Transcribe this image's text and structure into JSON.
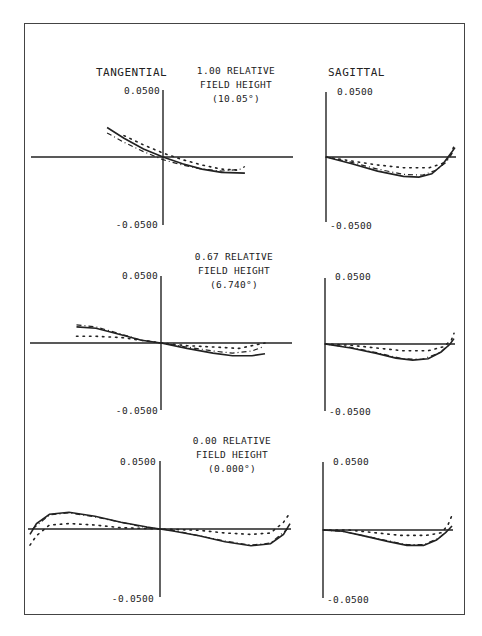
{
  "headers": {
    "tangential": "TANGENTIAL",
    "sagittal": "SAGITTAL"
  },
  "fields": [
    {
      "line1": "1.00 RELATIVE",
      "line2": "FIELD HEIGHT",
      "line3": "(10.05°)"
    },
    {
      "line1": "0.67 RELATIVE",
      "line2": "FIELD HEIGHT",
      "line3": "(6.740°)"
    },
    {
      "line1": "0.00 RELATIVE",
      "line2": "FIELD HEIGHT",
      "line3": "(0.000°)"
    }
  ],
  "axis_labels": {
    "top": "0.0500",
    "bottom": "-0.0500"
  },
  "colors": {
    "line": "#222222",
    "frame": "#444444",
    "background": "#ffffff"
  },
  "chart_data": [
    {
      "type": "line",
      "title": "TANGENTIAL — 1.00 RELATIVE FIELD HEIGHT (10.05°)",
      "xlabel": "relative pupil height",
      "ylabel": "ray aberration",
      "xlim": [
        -1,
        1
      ],
      "ylim": [
        -0.05,
        0.05
      ],
      "series": [
        {
          "name": "solid",
          "style": "solid",
          "points": [
            [
              -0.43,
              0.022
            ],
            [
              -0.3,
              0.014
            ],
            [
              -0.15,
              0.006
            ],
            [
              0,
              0.0
            ],
            [
              0.15,
              -0.005
            ],
            [
              0.3,
              -0.009
            ],
            [
              0.45,
              -0.0115
            ],
            [
              0.63,
              -0.012
            ]
          ]
        },
        {
          "name": "dashed",
          "style": "dashed",
          "points": [
            [
              -0.43,
              0.018
            ],
            [
              -0.3,
              0.011
            ],
            [
              -0.15,
              0.004
            ],
            [
              0,
              -0.002
            ],
            [
              0.15,
              -0.006
            ],
            [
              0.3,
              -0.009
            ],
            [
              0.45,
              -0.0105
            ],
            [
              0.6,
              -0.009
            ],
            [
              0.63,
              -0.007
            ]
          ]
        },
        {
          "name": "dotted",
          "style": "dotted",
          "points": [
            [
              -0.3,
              0.016
            ],
            [
              -0.15,
              0.009
            ],
            [
              0,
              0.003
            ],
            [
              0.15,
              -0.002
            ],
            [
              0.3,
              -0.006
            ],
            [
              0.45,
              -0.009
            ],
            [
              0.6,
              -0.01
            ]
          ]
        }
      ]
    },
    {
      "type": "line",
      "title": "SAGITTAL — 1.00 RELATIVE FIELD HEIGHT (10.05°)",
      "xlim": [
        0,
        1
      ],
      "ylim": [
        -0.05,
        0.05
      ],
      "series": [
        {
          "name": "solid",
          "style": "solid",
          "points": [
            [
              0,
              0
            ],
            [
              0.2,
              -0.005
            ],
            [
              0.4,
              -0.0105
            ],
            [
              0.6,
              -0.0145
            ],
            [
              0.72,
              -0.015
            ],
            [
              0.82,
              -0.0125
            ],
            [
              0.9,
              -0.006
            ],
            [
              0.97,
              0.003
            ],
            [
              1.0,
              0.007
            ]
          ]
        },
        {
          "name": "dashed",
          "style": "dashed",
          "points": [
            [
              0,
              0
            ],
            [
              0.2,
              -0.004
            ],
            [
              0.4,
              -0.009
            ],
            [
              0.6,
              -0.013
            ],
            [
              0.75,
              -0.0135
            ],
            [
              0.85,
              -0.01
            ],
            [
              0.93,
              -0.004
            ],
            [
              0.98,
              0.003
            ]
          ]
        },
        {
          "name": "dotted",
          "style": "dotted",
          "points": [
            [
              0,
              0
            ],
            [
              0.2,
              -0.003
            ],
            [
              0.4,
              -0.006
            ],
            [
              0.6,
              -0.008
            ],
            [
              0.8,
              -0.008
            ],
            [
              0.9,
              -0.005
            ],
            [
              0.96,
              0.0
            ],
            [
              1.0,
              0.01
            ]
          ]
        }
      ]
    },
    {
      "type": "line",
      "title": "TANGENTIAL — 0.67 RELATIVE FIELD HEIGHT (6.740°)",
      "xlim": [
        -1,
        1
      ],
      "ylim": [
        -0.05,
        0.05
      ],
      "series": [
        {
          "name": "solid",
          "style": "solid",
          "points": [
            [
              -0.65,
              0.012
            ],
            [
              -0.5,
              0.011
            ],
            [
              -0.3,
              0.006
            ],
            [
              -0.15,
              0.002
            ],
            [
              0,
              0.0
            ],
            [
              0.2,
              -0.004
            ],
            [
              0.4,
              -0.0075
            ],
            [
              0.55,
              -0.0095
            ],
            [
              0.7,
              -0.0095
            ],
            [
              0.8,
              -0.008
            ]
          ]
        },
        {
          "name": "dashed",
          "style": "dashed",
          "points": [
            [
              -0.65,
              0.0135
            ],
            [
              -0.5,
              0.012
            ],
            [
              -0.3,
              0.0065
            ],
            [
              -0.15,
              0.002
            ],
            [
              0,
              0.0
            ],
            [
              0.2,
              -0.003
            ],
            [
              0.4,
              -0.006
            ],
            [
              0.55,
              -0.0075
            ],
            [
              0.7,
              -0.006
            ],
            [
              0.78,
              -0.003
            ]
          ]
        },
        {
          "name": "dotted",
          "style": "dotted",
          "points": [
            [
              -0.65,
              0.005
            ],
            [
              -0.5,
              0.005
            ],
            [
              -0.3,
              0.004
            ],
            [
              -0.15,
              0.002
            ],
            [
              0,
              0.0
            ],
            [
              0.2,
              -0.002
            ],
            [
              0.4,
              -0.003
            ],
            [
              0.6,
              -0.004
            ],
            [
              0.8,
              0.0
            ]
          ]
        }
      ]
    },
    {
      "type": "line",
      "title": "SAGITTAL — 0.67 RELATIVE FIELD HEIGHT (6.740°)",
      "xlim": [
        0,
        1
      ],
      "ylim": [
        -0.05,
        0.05
      ],
      "series": [
        {
          "name": "solid",
          "style": "solid",
          "points": [
            [
              0,
              0
            ],
            [
              0.2,
              -0.003
            ],
            [
              0.4,
              -0.007
            ],
            [
              0.55,
              -0.0105
            ],
            [
              0.68,
              -0.012
            ],
            [
              0.8,
              -0.011
            ],
            [
              0.9,
              -0.006
            ],
            [
              0.97,
              0.0
            ],
            [
              1.0,
              0.004
            ]
          ]
        },
        {
          "name": "dashed",
          "style": "dashed",
          "points": [
            [
              0,
              0
            ],
            [
              0.2,
              -0.0025
            ],
            [
              0.4,
              -0.0065
            ],
            [
              0.6,
              -0.011
            ],
            [
              0.75,
              -0.0115
            ],
            [
              0.88,
              -0.007
            ],
            [
              0.96,
              -0.001
            ]
          ]
        },
        {
          "name": "dotted",
          "style": "dotted",
          "points": [
            [
              0,
              0
            ],
            [
              0.2,
              -0.001
            ],
            [
              0.4,
              -0.003
            ],
            [
              0.6,
              -0.005
            ],
            [
              0.8,
              -0.005
            ],
            [
              0.92,
              -0.002
            ],
            [
              0.98,
              0.003
            ],
            [
              1.0,
              0.008
            ]
          ]
        }
      ]
    },
    {
      "type": "line",
      "title": "TANGENTIAL — 0.00 RELATIVE FIELD HEIGHT (0.000°)",
      "xlim": [
        -1,
        1
      ],
      "ylim": [
        -0.05,
        0.05
      ],
      "series": [
        {
          "name": "solid",
          "style": "solid",
          "points": [
            [
              -1.0,
              -0.004
            ],
            [
              -0.95,
              0.004
            ],
            [
              -0.85,
              0.011
            ],
            [
              -0.7,
              0.0125
            ],
            [
              -0.5,
              0.0095
            ],
            [
              -0.3,
              0.005
            ],
            [
              -0.1,
              0.0015
            ],
            [
              0,
              0.0
            ],
            [
              0.1,
              -0.0015
            ],
            [
              0.3,
              -0.005
            ],
            [
              0.5,
              -0.0095
            ],
            [
              0.7,
              -0.0125
            ],
            [
              0.85,
              -0.011
            ],
            [
              0.95,
              -0.004
            ],
            [
              1.0,
              0.004
            ]
          ]
        },
        {
          "name": "dashed",
          "style": "dashed",
          "points": [
            [
              -0.98,
              0.0
            ],
            [
              -0.85,
              0.0105
            ],
            [
              -0.7,
              0.012
            ],
            [
              -0.5,
              0.009
            ],
            [
              -0.3,
              0.005
            ],
            [
              -0.1,
              0.001
            ],
            [
              0,
              0.0
            ],
            [
              0.1,
              -0.001
            ],
            [
              0.3,
              -0.005
            ],
            [
              0.5,
              -0.009
            ],
            [
              0.7,
              -0.012
            ],
            [
              0.85,
              -0.0105
            ],
            [
              0.98,
              0.0
            ]
          ]
        },
        {
          "name": "dotted",
          "style": "dotted",
          "points": [
            [
              -1.0,
              -0.012
            ],
            [
              -0.95,
              -0.005
            ],
            [
              -0.85,
              0.003
            ],
            [
              -0.7,
              0.004
            ],
            [
              -0.5,
              0.003
            ],
            [
              -0.3,
              0.001
            ],
            [
              0,
              0.0
            ],
            [
              0.3,
              -0.001
            ],
            [
              0.5,
              -0.003
            ],
            [
              0.7,
              -0.004
            ],
            [
              0.85,
              -0.003
            ],
            [
              0.95,
              0.005
            ],
            [
              1.0,
              0.012
            ]
          ]
        }
      ]
    },
    {
      "type": "line",
      "title": "SAGITTAL — 0.00 RELATIVE FIELD HEIGHT (0.000°)",
      "xlim": [
        0,
        1
      ],
      "ylim": [
        -0.05,
        0.05
      ],
      "series": [
        {
          "name": "solid",
          "style": "solid",
          "points": [
            [
              0,
              0
            ],
            [
              0.15,
              -0.001
            ],
            [
              0.3,
              -0.004
            ],
            [
              0.5,
              -0.0085
            ],
            [
              0.65,
              -0.0115
            ],
            [
              0.78,
              -0.0115
            ],
            [
              0.88,
              -0.0075
            ],
            [
              0.95,
              -0.002
            ],
            [
              1.0,
              0.003
            ]
          ]
        },
        {
          "name": "dashed",
          "style": "dashed",
          "points": [
            [
              0,
              0
            ],
            [
              0.15,
              -0.001
            ],
            [
              0.3,
              -0.004
            ],
            [
              0.5,
              -0.008
            ],
            [
              0.65,
              -0.011
            ],
            [
              0.78,
              -0.011
            ],
            [
              0.9,
              -0.006
            ],
            [
              0.97,
              0.0
            ]
          ]
        },
        {
          "name": "dotted",
          "style": "dotted",
          "points": [
            [
              0,
              0
            ],
            [
              0.2,
              0.0
            ],
            [
              0.4,
              -0.002
            ],
            [
              0.6,
              -0.004
            ],
            [
              0.8,
              -0.004
            ],
            [
              0.92,
              -0.002
            ],
            [
              0.97,
              0.004
            ],
            [
              1.0,
              0.011
            ]
          ]
        }
      ]
    }
  ]
}
